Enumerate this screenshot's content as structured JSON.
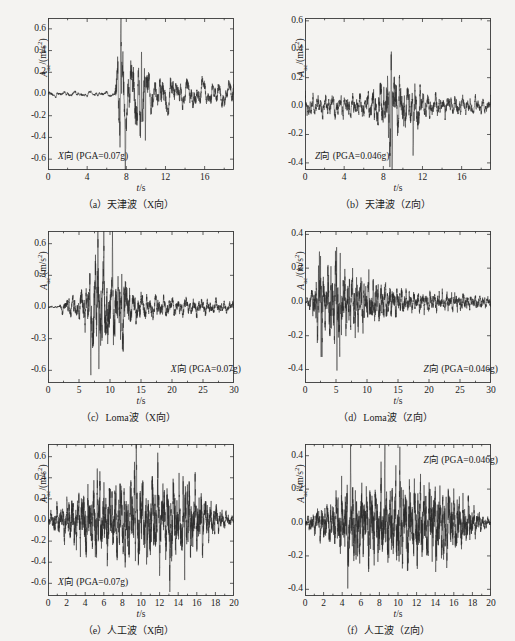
{
  "figure": {
    "background": "#f4f3f1",
    "line_color": "#2a2a2a",
    "axis_color": "#3a3a3a",
    "xlabel_sym": "t",
    "xlabel_unit": "/s",
    "ylabel_sym": "A",
    "ylabel_sub": "ac",
    "ylabel_unit": "/(m/s",
    "ylabel_exp": "2",
    "ylabel_close": ")"
  },
  "chart_data": [
    {
      "id": "a",
      "type": "line",
      "title": "（a）天津波（X向）",
      "annotation": "X向 (PGA=0.07g)",
      "annotation_dir": "X向",
      "annotation_pga": "(PGA=0.07g)",
      "annotation_pos": "bottom-left",
      "xlabel": "t/s",
      "ylabel": "A_ac/(m/s^2)",
      "xlim": [
        0,
        19
      ],
      "ylim": [
        -0.7,
        0.7
      ],
      "xticks": [
        0,
        4,
        8,
        12,
        16
      ],
      "yticks": [
        0.6,
        0.4,
        0.2,
        0.0,
        -0.2,
        -0.4,
        -0.6
      ],
      "ytick_labels": [
        "0.6",
        "0.4",
        "0.2",
        "0.0",
        "-0.2",
        "-0.4",
        "-0.6"
      ],
      "wave": {
        "seed": 1271,
        "n": 1400,
        "base_amp": 0.035,
        "envelope": [
          {
            "t": 0.0,
            "a": 0.05
          },
          {
            "t": 6.8,
            "a": 0.05
          },
          {
            "t": 7.2,
            "a": 0.92
          },
          {
            "t": 7.6,
            "a": 0.95
          },
          {
            "t": 8.2,
            "a": 0.55
          },
          {
            "t": 9.6,
            "a": 0.85
          },
          {
            "t": 10.2,
            "a": 0.42
          },
          {
            "t": 12.0,
            "a": 0.33
          },
          {
            "t": 14.0,
            "a": 0.26
          },
          {
            "t": 19.0,
            "a": 0.22
          }
        ],
        "peak_scale": 0.7,
        "freq": 4.4,
        "spikes": [
          {
            "t": 7.45,
            "v": 0.68
          },
          {
            "t": 7.35,
            "v": -0.5
          },
          {
            "t": 7.9,
            "v": -0.56
          },
          {
            "t": 9.55,
            "v": 0.43
          },
          {
            "t": 9.95,
            "v": -0.62
          }
        ]
      }
    },
    {
      "id": "b",
      "type": "line",
      "title": "（b）天津波（Z向）",
      "annotation": "Z向 (PGA=0.046g)",
      "annotation_dir": "Z向",
      "annotation_pga": "(PGA=0.046g)",
      "annotation_pos": "bottom-left",
      "xlabel": "t/s",
      "ylabel": "A_ac/(m/s^2)",
      "xlim": [
        0,
        19
      ],
      "ylim": [
        -0.45,
        0.62
      ],
      "xticks": [
        0,
        4,
        8,
        12,
        16
      ],
      "yticks": [
        0.6,
        0.4,
        0.2,
        0.0,
        -0.2,
        -0.4
      ],
      "ytick_labels": [
        "0.6",
        "0.4",
        "0.2",
        "0.0",
        "-0.2",
        "-0.4"
      ],
      "wave": {
        "seed": 5521,
        "n": 1700,
        "base_amp": 0.06,
        "envelope": [
          {
            "t": 0.0,
            "a": 0.22
          },
          {
            "t": 3.0,
            "a": 0.24
          },
          {
            "t": 6.0,
            "a": 0.26
          },
          {
            "t": 8.0,
            "a": 0.55
          },
          {
            "t": 8.8,
            "a": 1.0
          },
          {
            "t": 9.4,
            "a": 0.7
          },
          {
            "t": 10.5,
            "a": 0.4
          },
          {
            "t": 11.2,
            "a": 0.55
          },
          {
            "t": 12.5,
            "a": 0.26
          },
          {
            "t": 16.0,
            "a": 0.2
          },
          {
            "t": 19.0,
            "a": 0.16
          }
        ],
        "peak_scale": 0.44,
        "freq": 9.0,
        "spikes": [
          {
            "t": 8.8,
            "v": 0.44
          },
          {
            "t": 8.9,
            "v": -0.4
          },
          {
            "t": 8.55,
            "v": -0.37
          },
          {
            "t": 11.05,
            "v": -0.36
          }
        ]
      }
    },
    {
      "id": "c",
      "type": "line",
      "title": "（c）Loma波（X向）",
      "annotation": "X向 (PGA=0.07g)",
      "annotation_dir": "X向",
      "annotation_pga": "(PGA=0.07g)",
      "annotation_pos": "bottom-right",
      "xlabel": "t/s",
      "ylabel": "A_ac/(m/s^2)",
      "xlim": [
        0,
        30
      ],
      "ylim": [
        -0.72,
        0.72
      ],
      "xticks": [
        0,
        5,
        10,
        15,
        20,
        25,
        30
      ],
      "yticks": [
        0.6,
        0.3,
        0.0,
        -0.3,
        -0.6
      ],
      "ytick_labels": [
        "0.6",
        "0.3",
        "0.0",
        "-0.3",
        "-0.6"
      ],
      "wave": {
        "seed": 907,
        "n": 2100,
        "base_amp": 0.05,
        "envelope": [
          {
            "t": 0.0,
            "a": 0.01
          },
          {
            "t": 1.8,
            "a": 0.03
          },
          {
            "t": 3.0,
            "a": 0.18
          },
          {
            "t": 5.0,
            "a": 0.22
          },
          {
            "t": 6.5,
            "a": 0.55
          },
          {
            "t": 8.0,
            "a": 1.0
          },
          {
            "t": 9.5,
            "a": 0.7
          },
          {
            "t": 11.0,
            "a": 0.72
          },
          {
            "t": 12.2,
            "a": 0.68
          },
          {
            "t": 13.5,
            "a": 0.3
          },
          {
            "t": 16.0,
            "a": 0.22
          },
          {
            "t": 20.0,
            "a": 0.17
          },
          {
            "t": 25.0,
            "a": 0.15
          },
          {
            "t": 30.0,
            "a": 0.1
          }
        ],
        "peak_scale": 0.7,
        "freq": 5.2,
        "spikes": [
          {
            "t": 8.05,
            "v": 0.67
          },
          {
            "t": 8.2,
            "v": -0.65
          },
          {
            "t": 6.9,
            "v": -0.46
          },
          {
            "t": 9.0,
            "v": 0.42
          },
          {
            "t": 11.9,
            "v": 0.41
          },
          {
            "t": 11.7,
            "v": -0.37
          },
          {
            "t": 10.4,
            "v": 0.36
          }
        ]
      }
    },
    {
      "id": "d",
      "type": "line",
      "title": "（d）Loma波（Z向）",
      "annotation": "Z向 (PGA=0.046g)",
      "annotation_dir": "Z向",
      "annotation_pga": "(PGA=0.046g)",
      "annotation_pos": "bottom-right",
      "xlabel": "t/s",
      "ylabel": "A_ac/(m/s^2)",
      "xlim": [
        0,
        30
      ],
      "ylim": [
        -0.48,
        0.42
      ],
      "xticks": [
        0,
        5,
        10,
        15,
        20,
        25,
        30
      ],
      "yticks": [
        0.4,
        0.2,
        0.0,
        -0.2,
        -0.4
      ],
      "ytick_labels": [
        "0.4",
        "0.2",
        "0.0",
        "-0.2",
        "-0.4"
      ],
      "wave": {
        "seed": 3313,
        "n": 2200,
        "base_amp": 0.05,
        "envelope": [
          {
            "t": 0.0,
            "a": 0.02
          },
          {
            "t": 1.2,
            "a": 0.25
          },
          {
            "t": 2.4,
            "a": 0.95
          },
          {
            "t": 3.2,
            "a": 0.6
          },
          {
            "t": 5.0,
            "a": 1.0
          },
          {
            "t": 6.5,
            "a": 0.55
          },
          {
            "t": 8.5,
            "a": 0.6
          },
          {
            "t": 10.5,
            "a": 0.45
          },
          {
            "t": 12.5,
            "a": 0.38
          },
          {
            "t": 14.0,
            "a": 0.32
          },
          {
            "t": 17.0,
            "a": 0.2
          },
          {
            "t": 22.0,
            "a": 0.18
          },
          {
            "t": 26.0,
            "a": 0.16
          },
          {
            "t": 30.0,
            "a": 0.1
          }
        ],
        "peak_scale": 0.4,
        "freq": 9.5,
        "spikes": [
          {
            "t": 5.1,
            "v": 0.36
          },
          {
            "t": 5.15,
            "v": -0.45
          },
          {
            "t": 2.5,
            "v": 0.31
          },
          {
            "t": 2.6,
            "v": -0.32
          },
          {
            "t": 5.6,
            "v": -0.29
          }
        ]
      }
    },
    {
      "id": "e",
      "type": "line",
      "title": "（e）人工波（X向）",
      "annotation": "X向 (PGA=0.07g)",
      "annotation_dir": "X向",
      "annotation_pga": "(PGA=0.07g)",
      "annotation_pos": "bottom-left",
      "xlabel": "t/s",
      "ylabel": "A_ac/(m/s^2)",
      "xlim": [
        0,
        20
      ],
      "ylim": [
        -0.72,
        0.72
      ],
      "xticks": [
        0,
        2,
        4,
        6,
        8,
        10,
        12,
        14,
        16,
        18,
        20
      ],
      "yticks": [
        0.6,
        0.4,
        0.2,
        0.0,
        -0.2,
        -0.4,
        -0.6
      ],
      "ytick_labels": [
        "0.6",
        "0.4",
        "0.2",
        "0.0",
        "-0.2",
        "-0.4",
        "-0.6"
      ],
      "wave": {
        "seed": 7741,
        "n": 2600,
        "base_amp": 0.2,
        "envelope": [
          {
            "t": 0.0,
            "a": 0.1
          },
          {
            "t": 1.0,
            "a": 0.35
          },
          {
            "t": 2.5,
            "a": 0.55
          },
          {
            "t": 4.0,
            "a": 0.8
          },
          {
            "t": 6.0,
            "a": 0.85
          },
          {
            "t": 8.0,
            "a": 0.92
          },
          {
            "t": 9.5,
            "a": 1.0
          },
          {
            "t": 11.5,
            "a": 0.9
          },
          {
            "t": 13.0,
            "a": 0.95
          },
          {
            "t": 15.0,
            "a": 0.92
          },
          {
            "t": 16.5,
            "a": 0.7
          },
          {
            "t": 18.0,
            "a": 0.35
          },
          {
            "t": 19.5,
            "a": 0.14
          },
          {
            "t": 20.0,
            "a": 0.06
          }
        ],
        "peak_scale": 0.52,
        "freq": 11.0,
        "spikes": [
          {
            "t": 9.5,
            "v": 0.67
          },
          {
            "t": 9.3,
            "v": 0.6
          },
          {
            "t": 5.3,
            "v": 0.49
          },
          {
            "t": 11.8,
            "v": 0.47
          },
          {
            "t": 15.0,
            "v": 0.5
          },
          {
            "t": 13.1,
            "v": -0.58
          },
          {
            "t": 14.7,
            "v": -0.56
          },
          {
            "t": 10.6,
            "v": -0.55
          },
          {
            "t": 8.3,
            "v": -0.52
          }
        ]
      }
    },
    {
      "id": "f",
      "type": "line",
      "title": "（f）人工波（Z向）",
      "annotation": "Z向 (PGA=0.046g)",
      "annotation_dir": "Z向",
      "annotation_pga": "(PGA=0.046g)",
      "annotation_pos": "top-right",
      "xlabel": "t/s",
      "ylabel": "A_ac/(m/s^2)",
      "xlim": [
        0,
        20
      ],
      "ylim": [
        -0.44,
        0.47
      ],
      "xticks": [
        0,
        2,
        4,
        6,
        8,
        10,
        12,
        14,
        16,
        18,
        20
      ],
      "yticks": [
        0.4,
        0.2,
        0.0,
        -0.2,
        -0.4
      ],
      "ytick_labels": [
        "0.4",
        "0.2",
        "0.0",
        "-0.2",
        "-0.4"
      ],
      "wave": {
        "seed": 4409,
        "n": 2600,
        "base_amp": 0.2,
        "envelope": [
          {
            "t": 0.0,
            "a": 0.08
          },
          {
            "t": 1.0,
            "a": 0.28
          },
          {
            "t": 2.5,
            "a": 0.45
          },
          {
            "t": 4.0,
            "a": 0.75
          },
          {
            "t": 5.5,
            "a": 0.88
          },
          {
            "t": 7.5,
            "a": 0.85
          },
          {
            "t": 9.0,
            "a": 0.92
          },
          {
            "t": 10.2,
            "a": 1.0
          },
          {
            "t": 12.0,
            "a": 0.88
          },
          {
            "t": 13.5,
            "a": 0.92
          },
          {
            "t": 15.2,
            "a": 0.88
          },
          {
            "t": 16.8,
            "a": 0.6
          },
          {
            "t": 18.3,
            "a": 0.32
          },
          {
            "t": 19.6,
            "a": 0.12
          },
          {
            "t": 20.0,
            "a": 0.05
          }
        ],
        "peak_scale": 0.33,
        "freq": 12.0,
        "spikes": [
          {
            "t": 4.9,
            "v": 0.44
          },
          {
            "t": 10.2,
            "v": 0.43
          },
          {
            "t": 10.3,
            "v": -0.33
          },
          {
            "t": 8.6,
            "v": 0.33
          },
          {
            "t": 4.6,
            "v": -0.38
          },
          {
            "t": 14.9,
            "v": -0.33
          },
          {
            "t": 5.5,
            "v": -0.3
          }
        ]
      }
    }
  ],
  "footer_caption": ""
}
